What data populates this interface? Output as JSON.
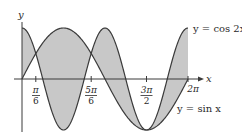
{
  "chart_data": {
    "type": "area",
    "title": "",
    "xlabel": "x",
    "ylabel": "y",
    "xlim": [
      0,
      6.2832
    ],
    "ylim": [
      -1,
      1
    ],
    "grid": false,
    "legend_position": "inline",
    "shading": "region between curves from 0 to 2π",
    "series": [
      {
        "name": "y = cos 2x",
        "label": "y = cos 2x",
        "expr": "cos(2x)"
      },
      {
        "name": "y = sin x",
        "label": "y = sin x",
        "expr": "sin(x)"
      }
    ],
    "x_ticks": [
      {
        "value": 0.5236,
        "num": "π",
        "den": "6"
      },
      {
        "value": 2.618,
        "num": "5π",
        "den": "6"
      },
      {
        "value": 4.7124,
        "num": "3π",
        "den": "2"
      },
      {
        "value": 6.2832,
        "label": "2π"
      }
    ],
    "intersections": [
      0.5236,
      2.618,
      4.7124
    ]
  },
  "axes": {
    "x_label": "x",
    "y_label": "y"
  },
  "labels": {
    "cos_curve": "y = cos 2x",
    "sin_curve": "y = sin x",
    "tick_pi6_num": "π",
    "tick_pi6_den": "6",
    "tick_5pi6_num": "5π",
    "tick_5pi6_den": "6",
    "tick_3pi2_num": "3π",
    "tick_3pi2_den": "2",
    "tick_2pi": "2π"
  },
  "colors": {
    "fill": "#c8c8c8",
    "curve": "#3a3a3a",
    "axis": "#3a3a3a",
    "text": "#2a2a2a"
  }
}
